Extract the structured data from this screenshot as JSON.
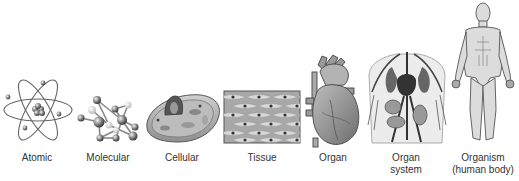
{
  "levels": [
    {
      "id": "atomic",
      "label": "Atomic",
      "icon": "atom-icon"
    },
    {
      "id": "molecular",
      "label": "Molecular",
      "icon": "molecule-icon"
    },
    {
      "id": "cellular",
      "label": "Cellular",
      "icon": "cell-icon"
    },
    {
      "id": "tissue",
      "label": "Tissue",
      "icon": "tissue-icon"
    },
    {
      "id": "organ",
      "label": "Organ",
      "icon": "heart-icon"
    },
    {
      "id": "organ-system",
      "label": "Organ",
      "label2": "system",
      "icon": "circulatory-system-icon"
    },
    {
      "id": "organism",
      "label": "Organism",
      "label2": "(human body)",
      "icon": "human-body-icon"
    }
  ],
  "colors": {
    "ink": "#333333",
    "shade": "#8a8a8a",
    "light": "#d6d6d6",
    "bg": "#ffffff"
  }
}
